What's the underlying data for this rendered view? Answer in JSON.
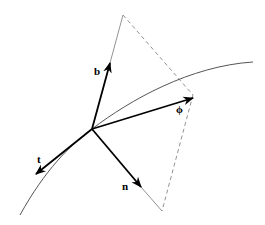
{
  "diagram": {
    "type": "frenet-frame-vector-diagram",
    "colors": {
      "background": "#ffffff",
      "vectors": "#000000",
      "curve": "#555555",
      "plane_edges": "#777777"
    },
    "origin": {
      "x": 92,
      "y": 129
    },
    "curve": {
      "start": {
        "x": 20,
        "y": 215
      },
      "end": {
        "x": 253,
        "y": 62
      }
    },
    "vectors": [
      {
        "id": "b",
        "label": "b",
        "tip": {
          "x": 110,
          "y": 63
        },
        "label_pos": {
          "x": 94,
          "y": 75
        }
      },
      {
        "id": "phi",
        "label": "ϕ",
        "tip": {
          "x": 193,
          "y": 98
        },
        "label_pos": {
          "x": 176,
          "y": 113
        }
      },
      {
        "id": "t",
        "label": "t",
        "tip": {
          "x": 36,
          "y": 174
        },
        "label_pos": {
          "x": 37,
          "y": 163
        }
      },
      {
        "id": "n",
        "label": "n",
        "tip": {
          "x": 141,
          "y": 187
        },
        "label_pos": {
          "x": 122,
          "y": 190
        }
      }
    ],
    "plane": {
      "top_vertex": {
        "x": 123,
        "y": 15
      },
      "right_vertex": {
        "x": 193,
        "y": 95
      },
      "bottom_vertex": {
        "x": 162,
        "y": 211
      }
    }
  }
}
